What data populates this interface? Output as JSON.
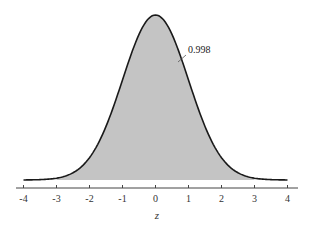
{
  "chart_data": {
    "type": "area",
    "title": "",
    "xlabel": "z",
    "ylabel": "",
    "xlim": [
      -4,
      4
    ],
    "x_ticks": [
      -4,
      -3,
      -2,
      -1,
      0,
      1,
      2,
      3,
      4
    ],
    "x_tick_labels": [
      "-4",
      "-3",
      "-2",
      "-1",
      "0",
      "1",
      "2",
      "3",
      "4"
    ],
    "shaded_region": {
      "from": -3,
      "to": 3,
      "area": 0.998
    },
    "annotations": [
      {
        "text": "0.998",
        "points_to": "shaded area"
      }
    ],
    "grid": false,
    "legend": null,
    "colors": {
      "curve": "#1a1a1a",
      "fill": "#c4c4c4",
      "axis": "#333333"
    }
  },
  "labels": {
    "annotation": "0.998",
    "xlabel": "z"
  }
}
